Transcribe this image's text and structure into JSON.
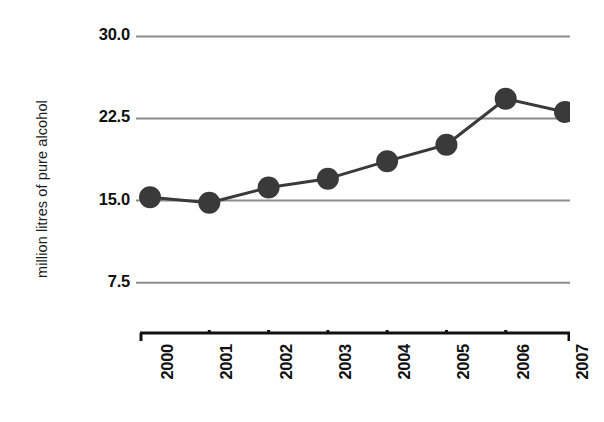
{
  "chart_data": {
    "type": "line",
    "title": "",
    "xlabel": "",
    "ylabel": "million litres of pure alcohol",
    "categories": [
      "2000",
      "2001",
      "2002",
      "2003",
      "2004",
      "2005",
      "2006",
      "2007"
    ],
    "values": [
      15.3,
      14.8,
      16.2,
      17.0,
      18.6,
      20.1,
      24.3,
      23.1
    ],
    "series": [
      {
        "name": "pure alcohol consumption",
        "values": [
          15.3,
          14.8,
          16.2,
          17.0,
          18.6,
          20.1,
          24.3,
          23.1
        ]
      }
    ],
    "ylim": [
      5.0,
      31.5
    ],
    "y_ticks": [
      30.0,
      22.5,
      15.0,
      7.5
    ],
    "y_tick_labels": [
      "30.0",
      "22.5",
      "15.0",
      "7.5"
    ],
    "xlim_categories": [
      "2000",
      "2007"
    ],
    "grid": "horizontal",
    "legend": "none",
    "marker": "circle",
    "colors": {
      "background": "#ffffff",
      "line": "#3a3a3a",
      "marker": "#3a3a3a",
      "gridline": "#8c8c8c",
      "axis": "#111111",
      "text": "#111111"
    }
  }
}
